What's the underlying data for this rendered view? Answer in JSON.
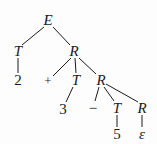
{
  "tree": {
    "title": "Parse tree for 2 + 3 - 5",
    "nodes": [
      {
        "id": "n0",
        "label": "E",
        "x": 48,
        "y": 20,
        "italic": true
      },
      {
        "id": "n1",
        "label": "T",
        "x": 18,
        "y": 51,
        "italic": true
      },
      {
        "id": "n2",
        "label": "R",
        "x": 74,
        "y": 51,
        "italic": true
      },
      {
        "id": "n3",
        "label": "2",
        "x": 18,
        "y": 80,
        "italic": false
      },
      {
        "id": "n4",
        "label": "+",
        "x": 48,
        "y": 81,
        "italic": false
      },
      {
        "id": "n5",
        "label": "T",
        "x": 76,
        "y": 80,
        "italic": true
      },
      {
        "id": "n6",
        "label": "R",
        "x": 101,
        "y": 80,
        "italic": true
      },
      {
        "id": "n7",
        "label": "3",
        "x": 63,
        "y": 109,
        "italic": false
      },
      {
        "id": "n8",
        "label": "−",
        "x": 93,
        "y": 108,
        "italic": false
      },
      {
        "id": "n9",
        "label": "T",
        "x": 117,
        "y": 108,
        "italic": true
      },
      {
        "id": "n10",
        "label": "R",
        "x": 142,
        "y": 108,
        "italic": true
      },
      {
        "id": "n11",
        "label": "5",
        "x": 117,
        "y": 134,
        "italic": false
      },
      {
        "id": "n12",
        "label": "ε",
        "x": 142,
        "y": 134,
        "italic": true
      }
    ],
    "edges": [
      {
        "from": "n0",
        "to": "n1",
        "x1": 44,
        "y1": 27,
        "x2": 22,
        "y2": 45
      },
      {
        "from": "n0",
        "to": "n2",
        "x1": 53,
        "y1": 27,
        "x2": 70,
        "y2": 45
      },
      {
        "from": "n1",
        "to": "n3",
        "x1": 18,
        "y1": 58,
        "x2": 18,
        "y2": 73
      },
      {
        "from": "n2",
        "to": "n4",
        "x1": 71,
        "y1": 58,
        "x2": 53,
        "y2": 76
      },
      {
        "from": "n2",
        "to": "n5",
        "x1": 75,
        "y1": 58,
        "x2": 76,
        "y2": 73
      },
      {
        "from": "n2",
        "to": "n6",
        "x1": 79,
        "y1": 58,
        "x2": 96,
        "y2": 74
      },
      {
        "from": "n5",
        "to": "n7",
        "x1": 73,
        "y1": 87,
        "x2": 66,
        "y2": 102
      },
      {
        "from": "n6",
        "to": "n8",
        "x1": 99,
        "y1": 87,
        "x2": 95,
        "y2": 101
      },
      {
        "from": "n6",
        "to": "n9",
        "x1": 104,
        "y1": 87,
        "x2": 114,
        "y2": 101
      },
      {
        "from": "n6",
        "to": "n10",
        "x1": 106,
        "y1": 84,
        "x2": 138,
        "y2": 102
      },
      {
        "from": "n9",
        "to": "n11",
        "x1": 117,
        "y1": 115,
        "x2": 117,
        "y2": 127
      },
      {
        "from": "n10",
        "to": "n12",
        "x1": 142,
        "y1": 115,
        "x2": 142,
        "y2": 127
      }
    ]
  },
  "colors": {
    "ink": "#1a1a1a",
    "background": "#fdfdfd"
  }
}
